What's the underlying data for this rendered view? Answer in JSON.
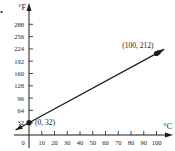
{
  "part_label": "a.",
  "chart_data": {
    "type": "line",
    "title": "",
    "xlabel": "°C",
    "ylabel": "°F",
    "x_ticks": [
      0,
      10,
      20,
      30,
      40,
      50,
      60,
      70,
      80,
      90,
      100
    ],
    "y_ticks": [
      32,
      64,
      96,
      128,
      160,
      192,
      224,
      256,
      288
    ],
    "xlim": [
      -10,
      108
    ],
    "ylim": [
      0,
      310
    ],
    "grid": false,
    "legend": null,
    "series": [
      {
        "name": "F = 9/5 C + 32",
        "x": [
          0,
          100
        ],
        "y": [
          32,
          212
        ],
        "extends_both_directions": true
      }
    ],
    "annotations": [
      {
        "text": "(0, 32)",
        "x": 0,
        "y": 32
      },
      {
        "text": "(100, 212)",
        "x": 100,
        "y": 212
      }
    ],
    "colors": {
      "axis": "#1a1a1a",
      "line": "#1a1a1a",
      "point": "#1a1a1a"
    }
  }
}
